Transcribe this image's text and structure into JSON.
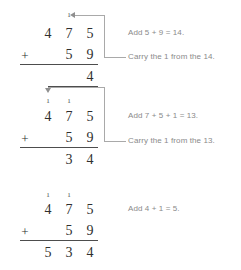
{
  "problem": {
    "addend_top": "475",
    "addend_bottom": "59",
    "operator": "+",
    "sum": "534"
  },
  "steps": [
    {
      "id": "step-ones",
      "top_digits": [
        "4",
        "7",
        "5"
      ],
      "bottom_digits": [
        "",
        "5",
        "9"
      ],
      "operator": "+",
      "carries": [
        "",
        "1",
        ""
      ],
      "result_digits": [
        "",
        "",
        "4"
      ],
      "note_add": "Add 5 + 9 = 14.",
      "note_carry": "Carry the 1 from the 14.",
      "arrow": "left"
    },
    {
      "id": "step-tens",
      "top_digits": [
        "4",
        "7",
        "5"
      ],
      "bottom_digits": [
        "",
        "5",
        "9"
      ],
      "operator": "+",
      "carries": [
        "1",
        "1",
        ""
      ],
      "result_digits": [
        "",
        "3",
        "4"
      ],
      "note_add": "Add 7 + 5 + 1 = 13.",
      "note_carry": "Carry the 1 from the 13.",
      "arrow": "down"
    },
    {
      "id": "step-hundreds",
      "top_digits": [
        "4",
        "7",
        "5"
      ],
      "bottom_digits": [
        "",
        "5",
        "9"
      ],
      "operator": "+",
      "carries": [
        "1",
        "1",
        ""
      ],
      "result_digits": [
        "5",
        "3",
        "4"
      ],
      "note_add": "Add 4 + 1 = 5.",
      "note_carry": "",
      "arrow": "none"
    }
  ],
  "colors": {
    "digit": "#2f2f2f",
    "note": "#8a8a8a",
    "connector": "#a9a9a9",
    "rule": "#4d4d4d",
    "background": "#ffffff"
  },
  "icons": {
    "arrow_left": "arrow-left-icon",
    "arrow_down": "arrow-down-icon"
  }
}
